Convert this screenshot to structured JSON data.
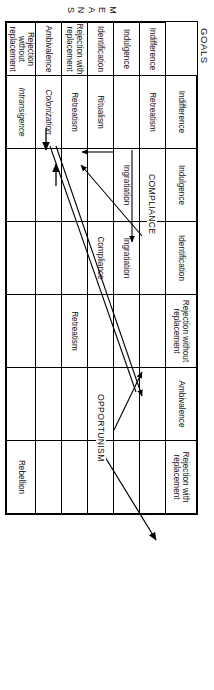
{
  "figure": {
    "orientation": "rotated-90",
    "column_axis_label": "GOALS",
    "row_axis_label_letters": [
      "M",
      "E",
      "A",
      "N",
      "S"
    ],
    "row_axis_label": "MEANS"
  },
  "columns": [
    {
      "id": "indifference",
      "label": "Indifference"
    },
    {
      "id": "indulgence",
      "label": "Indulgence"
    },
    {
      "id": "identification",
      "label": "Identification"
    },
    {
      "id": "rejection-without-replacement",
      "label": "Rejection without replacement"
    },
    {
      "id": "ambivalence",
      "label": "Ambivalence"
    },
    {
      "id": "rejection-with-replacement",
      "label": "Rejection with replacement"
    }
  ],
  "rows": [
    {
      "id": "indifference",
      "label": "Indifference"
    },
    {
      "id": "indulgence",
      "label": "Indulgence"
    },
    {
      "id": "identification",
      "label": "Identification"
    },
    {
      "id": "rejection-with-replacement",
      "label": "Rejection with replacement"
    },
    {
      "id": "ambivalence",
      "label": "Ambivalence"
    },
    {
      "id": "rejection-without-replacement",
      "label": "Rejection without replacement"
    }
  ],
  "cells": [
    [
      {
        "text": "Retreatism",
        "style": "normal"
      },
      {
        "text": "",
        "style": "normal"
      },
      {
        "text": "",
        "style": "normal"
      },
      {
        "text": "",
        "style": "normal"
      },
      {
        "text": "",
        "style": "normal"
      },
      {
        "text": "",
        "style": "normal"
      }
    ],
    [
      {
        "text": "",
        "style": "normal"
      },
      {
        "text": "Ingratiation",
        "style": "normal"
      },
      {
        "text": "Ingratiation",
        "style": "normal"
      },
      {
        "text": "",
        "style": "normal"
      },
      {
        "text": "",
        "style": "normal"
      },
      {
        "text": "",
        "style": "normal"
      }
    ],
    [
      {
        "text": "Ritualism",
        "style": "normal"
      },
      {
        "text": "",
        "style": "normal"
      },
      {
        "text": "Compliance",
        "style": "normal"
      },
      {
        "text": "",
        "style": "normal"
      },
      {
        "text": "",
        "style": "normal"
      },
      {
        "text": "",
        "style": "normal"
      }
    ],
    [
      {
        "text": "Retreatism",
        "style": "normal"
      },
      {
        "text": "",
        "style": "normal"
      },
      {
        "text": "",
        "style": "normal"
      },
      {
        "text": "Retreatism",
        "style": "normal"
      },
      {
        "text": "",
        "style": "normal"
      },
      {
        "text": "",
        "style": "normal"
      }
    ],
    [
      {
        "text": "Colonization",
        "style": "italic"
      },
      {
        "text": "",
        "style": "normal"
      },
      {
        "text": "",
        "style": "normal"
      },
      {
        "text": "",
        "style": "normal"
      },
      {
        "text": "",
        "style": "normal"
      },
      {
        "text": "",
        "style": "normal"
      }
    ],
    [
      {
        "text": "Intransigence",
        "style": "italic"
      },
      {
        "text": "",
        "style": "normal"
      },
      {
        "text": "",
        "style": "normal"
      },
      {
        "text": "",
        "style": "normal"
      },
      {
        "text": "",
        "style": "normal"
      },
      {
        "text": "Rebellion",
        "style": "normal"
      }
    ]
  ],
  "annotations": [
    {
      "id": "compliance-path",
      "label": "COMPLIANCE"
    },
    {
      "id": "opportunism-path",
      "label": "OPPORTUNISM"
    }
  ],
  "colors": {
    "ink": "#000000",
    "paper": "#ffffff"
  }
}
